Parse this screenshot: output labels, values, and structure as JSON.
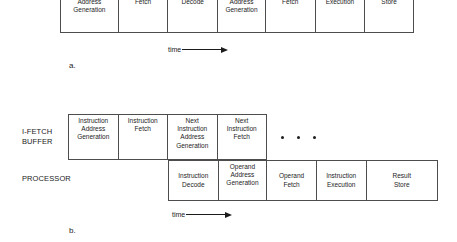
{
  "figure": {
    "diagram_a": {
      "caption": "a.",
      "time_axis_label": "time",
      "cells": [
        {
          "label": "Instruction\nAddress\nGeneration",
          "width": 58
        },
        {
          "label": "Instruction\nFetch",
          "width": 50
        },
        {
          "label": "Instruction\nDecode",
          "width": 50
        },
        {
          "label": "Operand\nAddress\nGeneration",
          "width": 48
        },
        {
          "label": "Operand\nFetch",
          "width": 50
        },
        {
          "label": "Instruction\nExecution",
          "width": 50
        },
        {
          "label": "Result\nStore",
          "width": 48
        }
      ]
    },
    "diagram_b": {
      "caption": "b.",
      "time_axis_label": "time",
      "ifetch_row": {
        "label": "I-FETCH\nBUFFER",
        "cells": [
          {
            "label": "Instruction\nAddress\nGeneration",
            "width": 50
          },
          {
            "label": "Instruction\nFetch",
            "width": 50
          },
          {
            "label": "Next\nInstruction\nAddress\nGeneration",
            "width": 50
          },
          {
            "label": "Next\nInstruction\nFetch",
            "width": 49
          }
        ],
        "ellipsis_dots": 3
      },
      "processor_row": {
        "label": "PROCESSOR",
        "cells": [
          {
            "label": "Instruction\nDecode",
            "width": 50
          },
          {
            "label": "Operand\nAddress\nGeneration",
            "width": 49
          },
          {
            "label": "Operand\nFetch",
            "width": 50
          },
          {
            "label": "Instruction\nExecution",
            "width": 50
          },
          {
            "label": "Result\nStore",
            "width": 71
          }
        ]
      }
    }
  }
}
